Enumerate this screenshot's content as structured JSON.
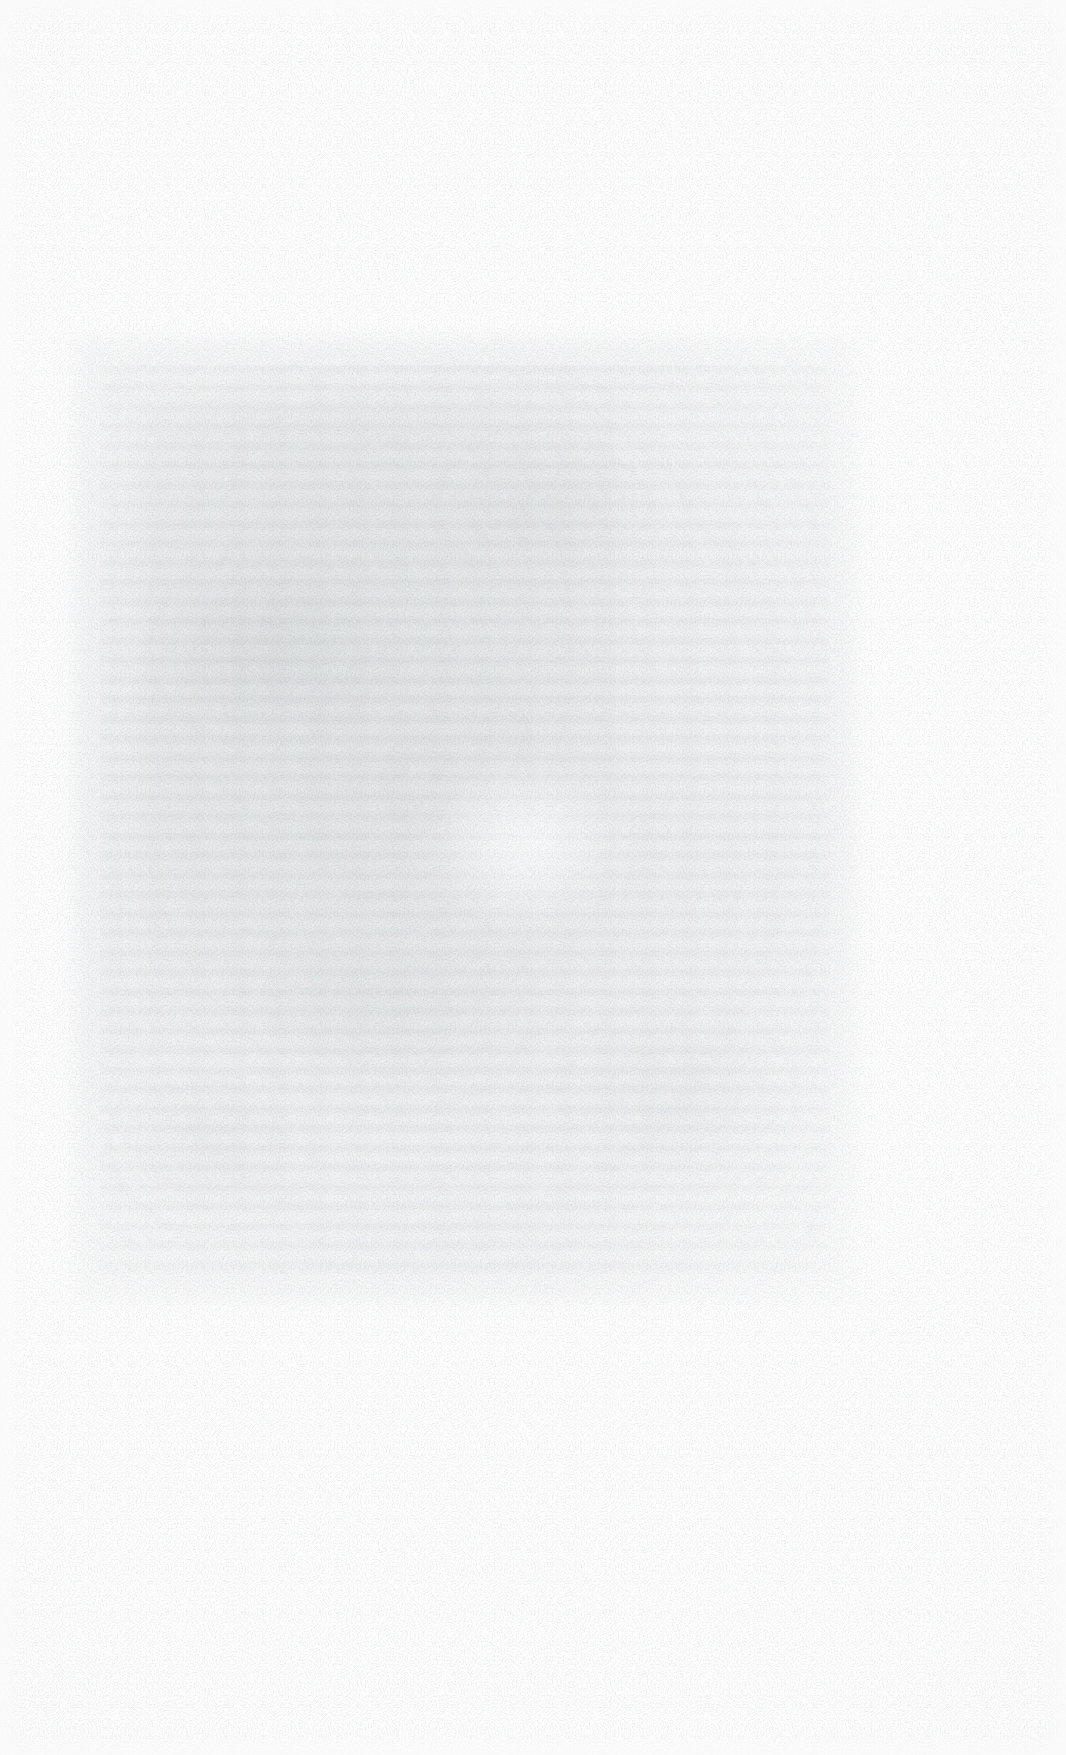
{
  "document": {
    "kind": "scanned-page",
    "legible_text": "",
    "note_rendered_content": "No legible characters resolve anywhere in the scan at 3x magnification; the page is a faded photocopy/scan containing only paper grain and the faint ghost of a printed text block.",
    "page_width_px": 1066,
    "page_height_px": 1755
  },
  "colors": {
    "page_background": "#ffffff",
    "paper_base": "#fefefe",
    "paper_tone_edge": "#f9f9f9",
    "grain_ink": "#787d84",
    "text_block_wash": "#7a7f87",
    "mottle": "#767c84"
  },
  "text_block": {
    "label": "",
    "left_px": 100,
    "top_px": 365,
    "width_px": 730,
    "height_px": 910,
    "right_px": 830,
    "bottom_px": 1275,
    "estimated_line_height_px": 19.5,
    "estimated_line_count": 46,
    "density": "very-faint"
  },
  "margins": {
    "top_px": 365,
    "bottom_px": 480,
    "left_px": 100,
    "right_px": 236
  },
  "header": {
    "text": ""
  },
  "footer": {
    "text": "",
    "page_number": ""
  }
}
